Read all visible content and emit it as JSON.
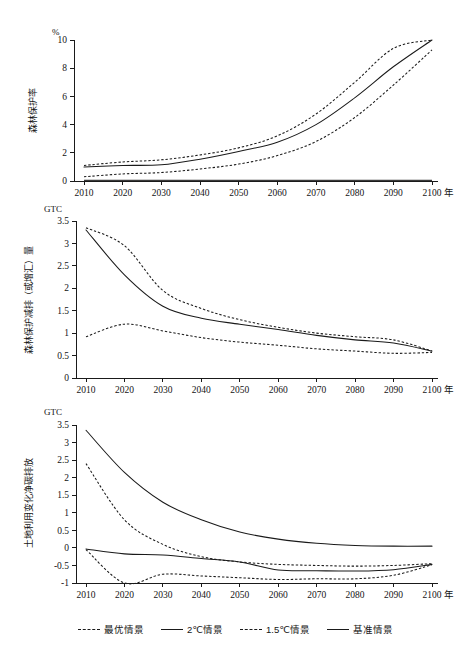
{
  "figure": {
    "unit_top": "%",
    "unit_mid": "GTC",
    "unit_bottom": "GTC",
    "x_axis_unit": "年"
  },
  "legend": {
    "items": [
      {
        "label": "最优情景",
        "style": "dashed"
      },
      {
        "label": "2℃情景",
        "style": "solid"
      },
      {
        "label": "1.5℃情景",
        "style": "dashed"
      },
      {
        "label": "基准情景",
        "style": "solid"
      }
    ]
  },
  "chart_data": [
    {
      "id": "forest-protection-rate",
      "type": "line",
      "title": "",
      "xlabel": "年",
      "ylabel": "森林保护率",
      "unit": "%",
      "x": [
        2010,
        2020,
        2030,
        2040,
        2050,
        2060,
        2070,
        2080,
        2090,
        2100
      ],
      "xlim": [
        2010,
        2100
      ],
      "ylim": [
        0,
        10
      ],
      "yticks": [
        0,
        2,
        4,
        6,
        8,
        10
      ],
      "xticks": [
        2010,
        2020,
        2030,
        2040,
        2050,
        2060,
        2070,
        2080,
        2090,
        2100
      ],
      "grid": false,
      "legend_position": "below-figure",
      "series": [
        {
          "name": "最优情景",
          "style": "dashed",
          "values": [
            1.1,
            1.35,
            1.5,
            1.85,
            2.35,
            3.2,
            4.75,
            7.0,
            9.4,
            10.0
          ]
        },
        {
          "name": "2℃情景",
          "style": "solid",
          "values": [
            1.0,
            1.1,
            1.15,
            1.55,
            2.1,
            2.75,
            4.0,
            5.9,
            8.1,
            10.0
          ]
        },
        {
          "name": "1.5℃情景",
          "style": "dashed",
          "values": [
            0.3,
            0.5,
            0.6,
            0.85,
            1.2,
            1.8,
            2.8,
            4.5,
            6.8,
            9.3
          ]
        },
        {
          "name": "基准情景",
          "style": "solid",
          "values": [
            0.05,
            0.05,
            0.05,
            0.05,
            0.05,
            0.05,
            0.05,
            0.05,
            0.05,
            0.05
          ]
        }
      ]
    },
    {
      "id": "forest-protection-emission-reduction",
      "type": "line",
      "title": "",
      "xlabel": "年",
      "ylabel": "森林保护减排（或增汇）量",
      "unit": "GTC",
      "x": [
        2010,
        2020,
        2030,
        2040,
        2050,
        2060,
        2070,
        2080,
        2090,
        2100
      ],
      "xlim": [
        2010,
        2100
      ],
      "ylim": [
        0,
        3.5
      ],
      "yticks": [
        0,
        0.5,
        1,
        1.5,
        2,
        2.5,
        3,
        3.5
      ],
      "xticks": [
        2010,
        2020,
        2030,
        2040,
        2050,
        2060,
        2070,
        2080,
        2090,
        2100
      ],
      "grid": false,
      "legend_position": "below-figure",
      "series": [
        {
          "name": "最优情景",
          "style": "dashed",
          "values": [
            3.35,
            2.95,
            1.95,
            1.55,
            1.3,
            1.13,
            1.0,
            0.92,
            0.85,
            0.6
          ]
        },
        {
          "name": "2℃情景",
          "style": "solid",
          "values": [
            3.3,
            2.3,
            1.6,
            1.33,
            1.2,
            1.08,
            0.95,
            0.85,
            0.78,
            0.6
          ]
        },
        {
          "name": "1.5℃情景",
          "style": "dashed",
          "values": [
            0.92,
            1.2,
            1.05,
            0.9,
            0.8,
            0.73,
            0.65,
            0.6,
            0.55,
            0.57
          ]
        },
        {
          "name": "基准情景",
          "style": "solid",
          "values": []
        }
      ]
    },
    {
      "id": "land-use-change-net-carbon-emission",
      "type": "line",
      "title": "",
      "xlabel": "年",
      "ylabel": "土地利用变化净碳排放",
      "unit": "GTC",
      "x": [
        2010,
        2020,
        2030,
        2040,
        2050,
        2060,
        2070,
        2080,
        2090,
        2100
      ],
      "xlim": [
        2010,
        2100
      ],
      "ylim": [
        -1,
        3.5
      ],
      "yticks": [
        -1,
        -0.5,
        0,
        0.5,
        1,
        1.5,
        2,
        2.5,
        3,
        3.5
      ],
      "xticks": [
        2010,
        2020,
        2030,
        2040,
        2050,
        2060,
        2070,
        2080,
        2090,
        2100
      ],
      "grid": false,
      "legend_position": "below-figure",
      "series": [
        {
          "name": "基准情景",
          "style": "solid",
          "values": [
            3.35,
            2.15,
            1.3,
            0.8,
            0.45,
            0.25,
            0.13,
            0.07,
            0.05,
            0.05
          ]
        },
        {
          "name": "最优情景",
          "style": "dashed",
          "values": [
            2.4,
            0.8,
            0.1,
            -0.25,
            -0.4,
            -0.47,
            -0.5,
            -0.52,
            -0.5,
            -0.45
          ]
        },
        {
          "name": "2℃情景",
          "style": "solid",
          "values": [
            -0.03,
            -0.17,
            -0.2,
            -0.3,
            -0.4,
            -0.63,
            -0.65,
            -0.66,
            -0.62,
            -0.47
          ]
        },
        {
          "name": "1.5℃情景",
          "style": "dashed",
          "values": [
            -0.05,
            -1.0,
            -0.75,
            -0.8,
            -0.85,
            -0.9,
            -0.88,
            -0.88,
            -0.78,
            -0.48
          ]
        }
      ]
    }
  ]
}
